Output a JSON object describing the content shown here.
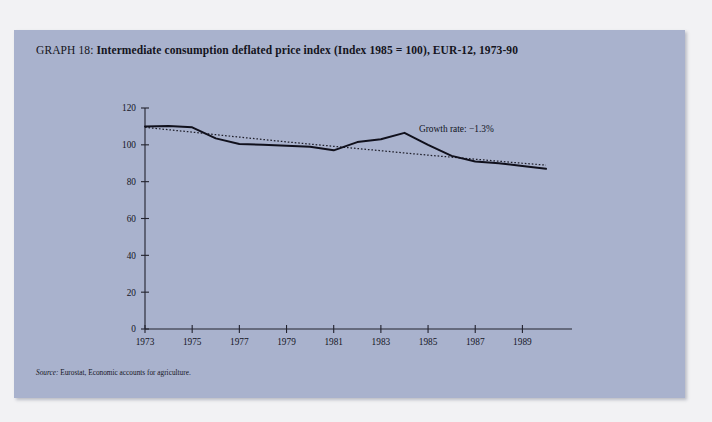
{
  "figure": {
    "label": "GRAPH 18",
    "separator": ":",
    "title": "Intermediate consumption deflated price index (Index 1985 = 100), EUR-12, 1973-90",
    "source_label": "Source:",
    "source_text": "Eurostat, Economic accounts for agriculture.",
    "background_color": "#a9b2cd",
    "page_color": "#f2f2f4",
    "ink_color": "#10101c"
  },
  "chart_data": {
    "type": "line",
    "title": "Intermediate consumption deflated price index (Index 1985 = 100), EUR-12, 1973-90",
    "xlabel": "",
    "ylabel": "",
    "xlim": [
      1973,
      1990
    ],
    "ylim": [
      0,
      120
    ],
    "ytick_values": [
      0,
      20,
      40,
      60,
      80,
      100,
      120
    ],
    "ytick_labels": [
      "0",
      "20",
      "40",
      "60",
      "80",
      "100",
      "120"
    ],
    "xtick_values": [
      1973,
      1975,
      1977,
      1979,
      1981,
      1983,
      1985,
      1987,
      1989
    ],
    "xtick_labels": [
      "1973",
      "1975",
      "1977",
      "1979",
      "1981",
      "1983",
      "1985",
      "1987",
      "1989"
    ],
    "grid": false,
    "legend_position": "none",
    "x": [
      1973,
      1974,
      1975,
      1976,
      1977,
      1978,
      1979,
      1980,
      1981,
      1982,
      1983,
      1984,
      1985,
      1986,
      1987,
      1988,
      1989,
      1990
    ],
    "series": [
      {
        "name": "Intermediate consumption deflated price index",
        "style": "solid",
        "values": [
          110.0,
          110.2,
          109.5,
          103.5,
          100.5,
          100.0,
          99.5,
          99.0,
          97.0,
          101.5,
          103.0,
          106.5,
          100.0,
          94.0,
          91.0,
          90.0,
          88.5,
          87.0
        ]
      },
      {
        "name": "Growth rate trend",
        "style": "dotted",
        "values": [
          109.5,
          108.2,
          106.9,
          105.5,
          104.2,
          102.9,
          101.6,
          100.4,
          99.2,
          98.0,
          96.8,
          95.6,
          94.4,
          93.3,
          92.2,
          91.1,
          90.0,
          89.0
        ]
      }
    ],
    "annotations": [
      {
        "name": "growth-rate",
        "text": "Growth rate: −1.3%",
        "x": 1986.2,
        "y": 107.0
      }
    ]
  }
}
